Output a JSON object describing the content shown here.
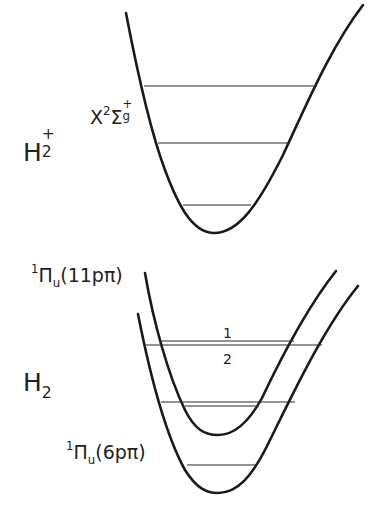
{
  "diagram": {
    "type": "potential-energy-curves",
    "colors": {
      "line": "#1a1a1a",
      "background": "#ffffff"
    },
    "ion": {
      "species": {
        "base": "H",
        "subscript": "2",
        "superscript": "+"
      },
      "state": {
        "letter": "X",
        "multiplicity": "2",
        "symbol": "Σ",
        "subscript": "g",
        "superscript": "+"
      },
      "vibrational_levels": 3
    },
    "neutral": {
      "species": {
        "base": "H",
        "subscript": "2"
      },
      "states": [
        {
          "multiplicity": "1",
          "symbol": "Π",
          "subscript": "u",
          "config": "(11pπ)",
          "vibrational_levels": 2
        },
        {
          "multiplicity": "1",
          "symbol": "Π",
          "subscript": "u",
          "config": "(6pπ)",
          "vibrational_levels": 3
        }
      ],
      "level_markers": [
        "1",
        "2"
      ]
    }
  }
}
